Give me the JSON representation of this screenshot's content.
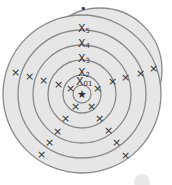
{
  "diagram": {
    "type": "concentric-target",
    "center_symbol": "★",
    "top_dot": "•",
    "ring_labels": [
      {
        "base": "X",
        "sub": "0",
        "sub2": "1"
      },
      {
        "base": "X",
        "sub": "2"
      },
      {
        "base": "X",
        "sub": "3"
      },
      {
        "base": "X",
        "sub": "4"
      },
      {
        "base": "X",
        "sub": "5"
      }
    ],
    "marker_glyph": "×",
    "colors": {
      "ring_fill": "#e6e6e6",
      "ring_stroke": "#8a8a8a",
      "text": "#333333",
      "background": "#ffffff"
    }
  }
}
